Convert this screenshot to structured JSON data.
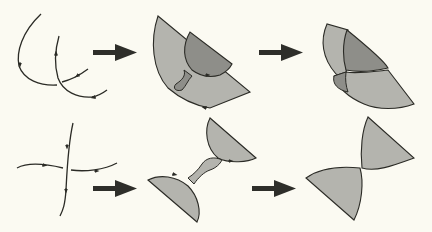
{
  "diagram": {
    "title": "",
    "background": "#fbfaf2",
    "colors": {
      "stroke": "#2b2b26",
      "arrow": "#2e2e2a",
      "light_fill": "#b4b4ae",
      "dark_fill": "#8e8e89"
    },
    "rows": [
      {
        "name": "top-row",
        "steps": [
          {
            "name": "two-oriented-arcs",
            "description": "two curved oriented arcs crossing"
          },
          {
            "name": "half-discs-with-twisted-band",
            "description": "two shaded half-discs connected by a twisted band"
          },
          {
            "name": "merged-surface",
            "description": "merged shaded surface"
          }
        ]
      },
      {
        "name": "bottom-row",
        "steps": [
          {
            "name": "crossing-oriented-arcs",
            "description": "vertical and horizontal oriented arcs crossing"
          },
          {
            "name": "half-discs-with-twisted-band",
            "description": "two shaded half-discs joined by twisted band"
          },
          {
            "name": "bowtie-surface",
            "description": "two shaded sectors meeting at a point"
          }
        ]
      }
    ],
    "arrows": [
      {
        "name": "arrow-top-1",
        "direction": "right"
      },
      {
        "name": "arrow-top-2",
        "direction": "right"
      },
      {
        "name": "arrow-bottom-1",
        "direction": "right"
      },
      {
        "name": "arrow-bottom-2",
        "direction": "right"
      }
    ]
  }
}
